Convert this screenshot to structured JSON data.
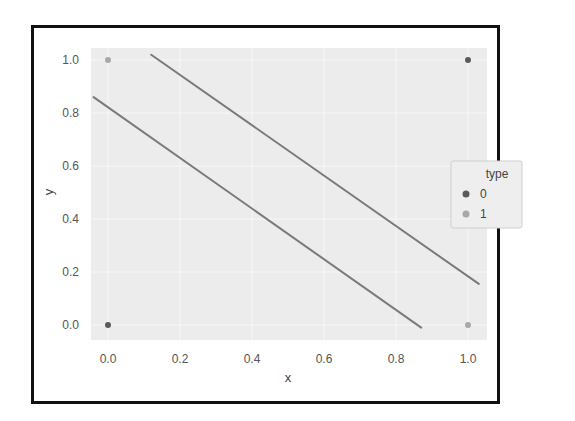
{
  "chart_data": {
    "type": "scatter",
    "title": "",
    "xlabel": "x",
    "ylabel": "y",
    "xlim": [
      -0.05,
      1.05
    ],
    "ylim": [
      -0.06,
      1.04
    ],
    "xticks": [
      0.0,
      0.2,
      0.4,
      0.6,
      0.8,
      1.0
    ],
    "yticks": [
      0.0,
      0.2,
      0.4,
      0.6,
      0.8,
      1.0
    ],
    "xtick_labels": [
      "0.0",
      "0.2",
      "0.4",
      "0.6",
      "0.8",
      "1.0"
    ],
    "ytick_labels": [
      "0.0",
      "0.2",
      "0.4",
      "0.6",
      "0.8",
      "1.0"
    ],
    "grid": true,
    "series": [
      {
        "name": "0",
        "color": "#5a5a5a",
        "points": [
          {
            "x": 0.0,
            "y": 0.0
          },
          {
            "x": 1.0,
            "y": 1.0
          }
        ]
      },
      {
        "name": "1",
        "color": "#a8a8a8",
        "points": [
          {
            "x": 0.0,
            "y": 1.0
          },
          {
            "x": 1.0,
            "y": 0.0
          }
        ]
      }
    ],
    "lines": [
      {
        "name": "upper-boundary",
        "color": "#7a7a7a",
        "x": [
          0.12,
          1.03
        ],
        "y": [
          1.02,
          0.155
        ]
      },
      {
        "name": "lower-boundary",
        "color": "#7a7a7a",
        "x": [
          -0.04,
          0.87
        ],
        "y": [
          0.86,
          -0.01
        ]
      }
    ],
    "legend": {
      "title": "type",
      "entries": [
        "0",
        "1"
      ],
      "placement": "center-right"
    }
  }
}
